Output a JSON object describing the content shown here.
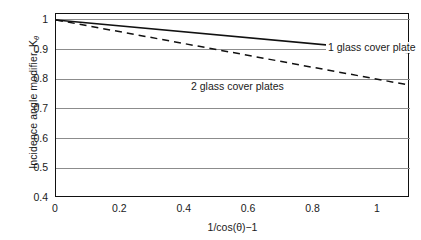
{
  "chart_data": {
    "type": "line",
    "title": "",
    "xlabel": "1/cos(θ)−1",
    "ylabel": "Incidence angle modifier, K",
    "ylabel_subscript": "θ",
    "xlim": [
      0,
      1.1
    ],
    "ylim": [
      0.4,
      1.02
    ],
    "xticks": [
      "0",
      "0.2",
      "0.4",
      "0.6",
      "0.8",
      "1"
    ],
    "xtick_values": [
      0,
      0.2,
      0.4,
      0.6,
      0.8,
      1
    ],
    "yticks": [
      "1",
      "0.9",
      "0.8",
      "0.7",
      "0.6",
      "0.5",
      "0.4"
    ],
    "ytick_values": [
      1,
      0.9,
      0.8,
      0.7,
      0.6,
      0.5,
      0.4
    ],
    "grid": "horizontal",
    "legend_position": "inline-annotations",
    "series": [
      {
        "name": "1 glass cover plate",
        "style": "solid",
        "color": "#111111",
        "x": [
          0,
          1.1
        ],
        "values": [
          1.0,
          0.89
        ],
        "slope": -0.1
      },
      {
        "name": "2 glass cover plates",
        "style": "dashed",
        "color": "#111111",
        "x": [
          0,
          1.1
        ],
        "values": [
          1.0,
          0.78
        ],
        "slope": -0.2
      }
    ],
    "annotations": [
      {
        "text": "1 glass cover plate",
        "x": 0.67,
        "y": 0.955
      },
      {
        "text": "2 glass cover plates",
        "x": 0.245,
        "y": 0.825
      }
    ],
    "gridline_color": "#8c8c8c",
    "frame_color": "#111111",
    "background": "#ffffff"
  }
}
